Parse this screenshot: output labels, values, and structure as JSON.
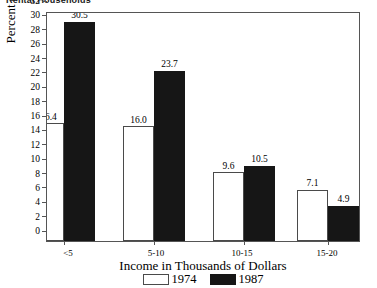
{
  "clipped_title": "Rental Households",
  "chart_data": {
    "type": "bar",
    "title": "Rental Households",
    "xlabel": "Income in Thousands of Dollars",
    "ylabel": "Percent of Rental Households",
    "categories": [
      "<5",
      "5-10",
      "10-15",
      "15-20",
      "20-25"
    ],
    "series": [
      {
        "name": "1974",
        "color": "#ffffff",
        "values": [
          16.4,
          16.0,
          9.6,
          7.1,
          6.0
        ],
        "labels": [
          "16.4",
          "16.0",
          "9.6",
          "7.1",
          "6.0"
        ]
      },
      {
        "name": "1987",
        "color": "#161616",
        "values": [
          30.5,
          23.7,
          10.5,
          4.9,
          3.2
        ],
        "labels": [
          "30.5",
          "23.7",
          "10.5",
          "4.9",
          "3.2"
        ]
      }
    ],
    "ylim": [
      0,
      32
    ],
    "yticks": [
      0,
      2,
      4,
      6,
      8,
      10,
      12,
      14,
      16,
      18,
      20,
      22,
      24,
      26,
      28,
      30,
      32
    ],
    "ytick_labels": [
      "0",
      "2",
      "4",
      "6",
      "8",
      "10",
      "12",
      "14",
      "16",
      "18",
      "20",
      "22",
      "24",
      "26",
      "28",
      "30",
      "32"
    ],
    "grid": false,
    "legend_position": "bottom"
  }
}
